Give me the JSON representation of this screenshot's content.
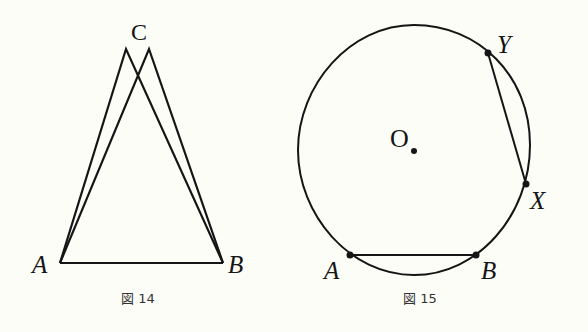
{
  "figures": [
    {
      "id": "fig14",
      "caption": "図 14",
      "description": "Two triangles sharing base AB with slightly different apexes labeled C",
      "labels": {
        "A": "A",
        "B": "B",
        "C": "C"
      },
      "points": {
        "A": [
          60,
          263
        ],
        "B": [
          223,
          263
        ],
        "C1": [
          126,
          49
        ],
        "C2": [
          149,
          49
        ]
      },
      "segments": [
        [
          "A",
          "B"
        ],
        [
          "A",
          "C1"
        ],
        [
          "C1",
          "B"
        ],
        [
          "A",
          "C2"
        ],
        [
          "C2",
          "B"
        ]
      ]
    },
    {
      "id": "fig15",
      "caption": "図 15",
      "description": "Circle with center O, chord AB and chord YX",
      "labels": {
        "O": "O",
        "A": "A",
        "B": "B",
        "X": "X",
        "Y": "Y"
      },
      "circle": {
        "cx": 414,
        "cy": 150,
        "rx": 116,
        "ry": 125
      },
      "points": {
        "O": [
          414,
          151
        ],
        "A": [
          350,
          255
        ],
        "B": [
          476,
          255
        ],
        "X": [
          526,
          184
        ],
        "Y": [
          488,
          53
        ]
      },
      "segments": [
        [
          "A",
          "B"
        ],
        [
          "Y",
          "X"
        ]
      ]
    }
  ],
  "colors": {
    "ink": "#151515",
    "background": "#fdfdf8",
    "caption": "#333333"
  }
}
